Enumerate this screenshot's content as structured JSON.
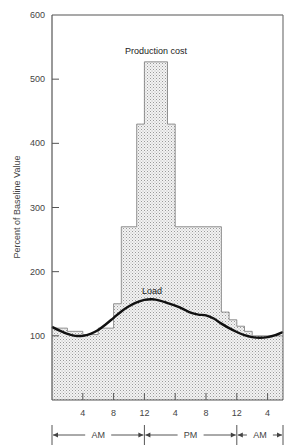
{
  "chart_data": {
    "type": "area",
    "title": "",
    "xlabel": "",
    "ylabel": "Percent of Baseline Value",
    "ylim": [
      0,
      600
    ],
    "yticks": [
      100,
      200,
      300,
      400,
      500,
      600
    ],
    "xlim_hours": [
      0,
      30
    ],
    "xtick_hours": [
      4,
      8,
      12,
      16,
      20,
      24,
      28
    ],
    "xtick_labels": [
      "4",
      "8",
      "12",
      "4",
      "8",
      "12",
      "4"
    ],
    "periods": [
      {
        "label": "AM",
        "start_hour": 0,
        "end_hour": 12
      },
      {
        "label": "PM",
        "start_hour": 12,
        "end_hour": 24
      },
      {
        "label": "AM",
        "start_hour": 24,
        "end_hour": 30
      }
    ],
    "grid": false,
    "legend": "none",
    "series": [
      {
        "name": "Production cost",
        "style": "step",
        "steps": [
          {
            "start": 0,
            "end": 2,
            "value": 112
          },
          {
            "start": 2,
            "end": 4,
            "value": 107
          },
          {
            "start": 4,
            "end": 6,
            "value": 102
          },
          {
            "start": 6,
            "end": 8,
            "value": 112
          },
          {
            "start": 8,
            "end": 9,
            "value": 150
          },
          {
            "start": 9,
            "end": 11,
            "value": 270
          },
          {
            "start": 11,
            "end": 12,
            "value": 430
          },
          {
            "start": 12,
            "end": 15,
            "value": 527
          },
          {
            "start": 15,
            "end": 16,
            "value": 430
          },
          {
            "start": 16,
            "end": 22,
            "value": 270
          },
          {
            "start": 22,
            "end": 23,
            "value": 137
          },
          {
            "start": 23,
            "end": 24,
            "value": 125
          },
          {
            "start": 24,
            "end": 25,
            "value": 115
          },
          {
            "start": 25,
            "end": 26,
            "value": 107
          },
          {
            "start": 26,
            "end": 30,
            "value": 100
          }
        ]
      },
      {
        "name": "Load",
        "style": "line",
        "x": [
          0,
          1,
          2,
          3,
          4,
          5,
          6,
          7,
          8,
          9,
          10,
          11,
          12,
          13,
          14,
          15,
          16,
          17,
          18,
          19,
          20,
          21,
          22,
          23,
          24,
          25,
          26,
          27,
          28,
          29,
          30
        ],
        "values": [
          114,
          108,
          103,
          100,
          100,
          103,
          109,
          118,
          128,
          138,
          146,
          152,
          156,
          157,
          155,
          151,
          147,
          142,
          136,
          133,
          132,
          127,
          119,
          112,
          106,
          101,
          98,
          97,
          98,
          101,
          106
        ]
      }
    ],
    "annotations": [
      {
        "text": "Production cost",
        "x_hour": 13.5,
        "y": 540
      },
      {
        "text": "Load",
        "x_hour": 13,
        "y": 165
      }
    ]
  },
  "labels": {
    "ylabel": "Percent of Baseline Value",
    "production_cost": "Production cost",
    "load": "Load",
    "am1": "AM",
    "pm": "PM",
    "am2": "AM"
  }
}
